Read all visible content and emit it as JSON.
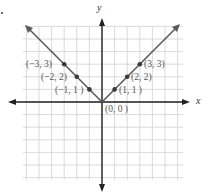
{
  "chart_data": {
    "type": "line",
    "title": "",
    "function": "y = |x|",
    "xlabel": "x",
    "ylabel": "y",
    "xlim": [
      -6.4,
      6.4
    ],
    "ylim": [
      -6,
      6.1
    ],
    "grid": true,
    "series": [
      {
        "name": "y = |x|",
        "color": "#555555",
        "points": [
          {
            "x": -3,
            "y": 3,
            "label": "(−3, 3)"
          },
          {
            "x": -2,
            "y": 2,
            "label": "(−2, 2)"
          },
          {
            "x": -1,
            "y": 1,
            "label": "(−1, 1 )"
          },
          {
            "x": 0,
            "y": 0,
            "label": "(0, 0 )"
          },
          {
            "x": 1,
            "y": 1,
            "label": "(1, 1 )"
          },
          {
            "x": 2,
            "y": 2,
            "label": "(2, 2)"
          },
          {
            "x": 3,
            "y": 3,
            "label": "(3, 3)"
          }
        ]
      }
    ]
  },
  "labels": {
    "x_axis": "x",
    "y_axis": "y",
    "p_m3": "(−3, 3)",
    "p_m2": "(−2, 2)",
    "p_m1": "(−1, 1 )",
    "p_0": "(0, 0 )",
    "p_1": "(1, 1 )",
    "p_2": "(2, 2)",
    "p_3": "(3, 3)"
  },
  "colors": {
    "grid": "#d0d0d0",
    "axis": "#222222",
    "line": "#5a5a5a",
    "point": "#3a3a3a"
  }
}
